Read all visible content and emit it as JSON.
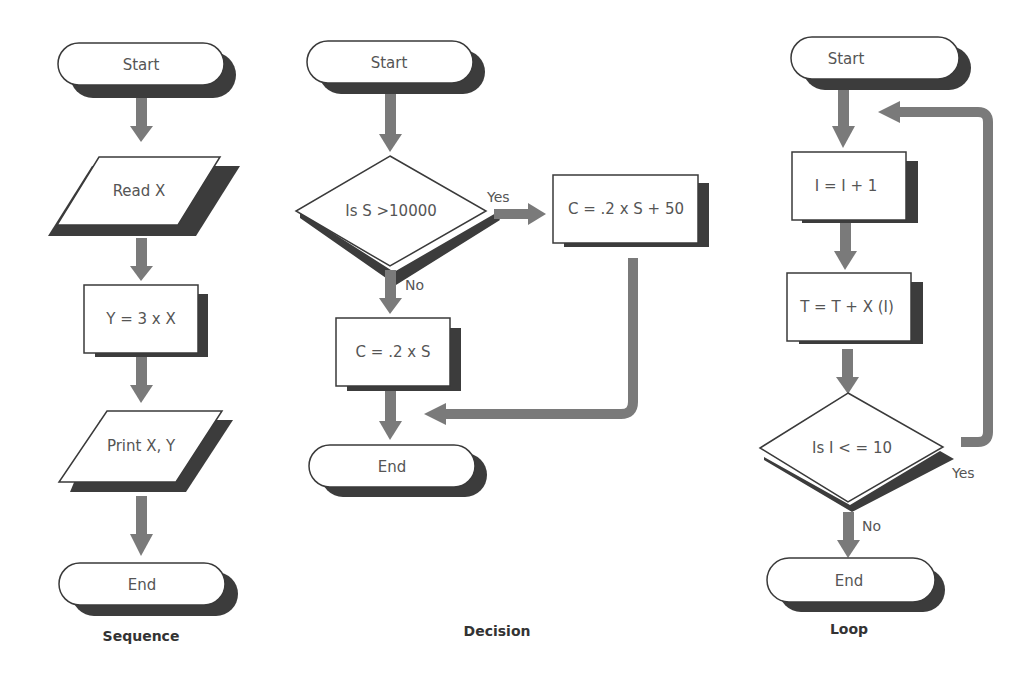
{
  "sequence": {
    "caption": "Sequence",
    "nodes": {
      "start": "Start",
      "read": "Read X",
      "compute": "Y = 3 x X",
      "print": "Print X, Y",
      "end": "End"
    }
  },
  "decision": {
    "caption": "Decision",
    "nodes": {
      "start": "Start",
      "condition": "Is S >10000",
      "yes_process": "C = .2 x S + 50",
      "no_process": "C = .2 x S",
      "end": "End"
    },
    "edges": {
      "yes": "Yes",
      "no": "No"
    }
  },
  "loop": {
    "caption": "Loop",
    "nodes": {
      "start": "Start",
      "increment": "I = I + 1",
      "accumulate": "T = T +  X (I)",
      "condition": "Is I < = 10",
      "end": "End"
    },
    "edges": {
      "yes": "Yes",
      "no": "No"
    }
  },
  "colors": {
    "shadow": "#3c3c3c",
    "arrow": "#7a7a7a",
    "outline": "#3a3a3a",
    "text": "#555555"
  }
}
